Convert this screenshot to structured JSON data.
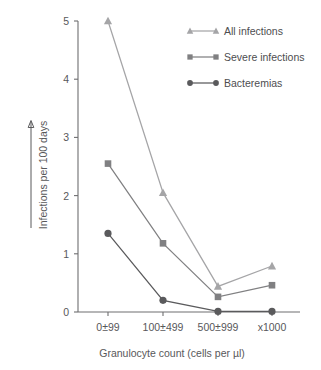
{
  "chart_data": {
    "type": "line",
    "title": "",
    "subtitle": "",
    "xlabel": "Granulocyte count (cells per µl)",
    "ylabel": "Infections per 100 days",
    "categories": [
      "0±99",
      "100±499",
      "500±999",
      "x1000"
    ],
    "ylim": [
      0,
      5
    ],
    "yticks": [
      0,
      1,
      2,
      3,
      4,
      5
    ],
    "ytick_labels": [
      "0",
      "1",
      "2",
      "3",
      "4",
      "5"
    ],
    "grid": false,
    "legend_position": "top-right",
    "series": [
      {
        "name": "All infections",
        "marker": "triangle",
        "color": "#a5a5a7",
        "values": [
          5.0,
          2.05,
          0.44,
          0.79
        ]
      },
      {
        "name": "Severe infections",
        "marker": "square",
        "color": "#808082",
        "values": [
          2.55,
          1.18,
          0.26,
          0.46
        ]
      },
      {
        "name": "Bacteremias",
        "marker": "circle",
        "color": "#5a5a5c",
        "values": [
          1.35,
          0.2,
          0.01,
          0.01
        ]
      }
    ]
  },
  "axes": {
    "y_axis_arrow": "upward-arrow-annotation"
  },
  "colors": {
    "axis": "#6e6e70",
    "text": "#58585a",
    "background": "#ffffff",
    "all_infections": "#a5a5a7",
    "severe_infections": "#808082",
    "bacteremias": "#5a5a5c"
  }
}
